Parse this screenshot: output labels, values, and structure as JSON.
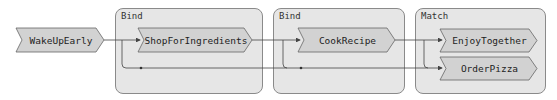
{
  "colors": {
    "group_fill": "#e6e6e6",
    "group_border": "#8a8a8a",
    "node_fill": "#d2d2d2",
    "node_border": "#666666",
    "edge": "#444444"
  },
  "groups": [
    {
      "id": "bind1",
      "label": "Bind"
    },
    {
      "id": "bind2",
      "label": "Bind"
    },
    {
      "id": "match",
      "label": "Match"
    }
  ],
  "nodes": [
    {
      "id": "wake",
      "label": "WakeUpEarly"
    },
    {
      "id": "shop",
      "label": "ShopForIngredients"
    },
    {
      "id": "cook",
      "label": "CookRecipe"
    },
    {
      "id": "enjoy",
      "label": "EnjoyTogether"
    },
    {
      "id": "pizza",
      "label": "OrderPizza"
    }
  ],
  "edges": [
    {
      "from": "WakeUpEarly",
      "to": "ShopForIngredients"
    },
    {
      "from": "WakeUpEarly",
      "to": "Bind bypass (failure track)"
    },
    {
      "from": "ShopForIngredients",
      "to": "CookRecipe"
    },
    {
      "from": "CookRecipe",
      "to": "EnjoyTogether"
    },
    {
      "from": "CookRecipe",
      "to": "OrderPizza"
    },
    {
      "from": "failure track",
      "to": "OrderPizza"
    }
  ]
}
